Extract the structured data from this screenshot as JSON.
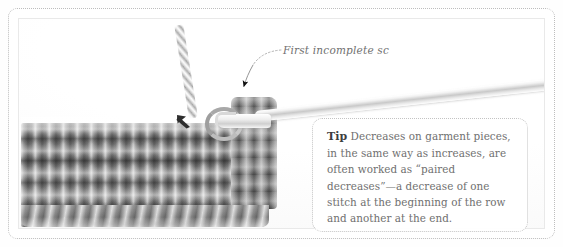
{
  "figure": {
    "kind": "crochet-instruction-photo",
    "photo_subject": "Single crochet decrease in progress on a gray crochet swatch with a metal hook"
  },
  "annotation": {
    "caption": "First incomplete sc",
    "leader_style": "dotted-curve-with-arrowhead",
    "arrow_color": "#1a1a1a",
    "stitch_pointer": "gray-arrow-up-left"
  },
  "tip": {
    "label": "Tip",
    "body": " Decreases on garment pieces, in the same way as increases, are often worked as “paired decreases”—a decrease of one stitch at the beginning of the row and another at the end.",
    "lines": [
      "Tip Decreases on garment pieces,",
      "in the same way as increases,",
      "are often worked as “paired",
      "decreases”—a decrease of one",
      "stitch at the beginning of the",
      "row and another at the end."
    ]
  },
  "colors": {
    "frame_border": "#bdbdbd",
    "plate_border": "#e9e9e9",
    "tip_border": "#c3c3c3",
    "tip_text": "#6f6f6f",
    "tip_label_text": "#3d3d3d",
    "caption_text": "#707070",
    "yarn_gray": "#8d8d8d",
    "hook_silver": "#e8e8e8",
    "page_background": "#ffffff"
  }
}
